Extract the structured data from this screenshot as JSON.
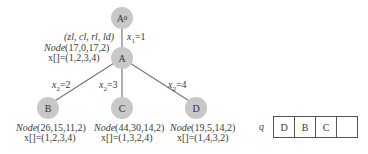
{
  "tree": {
    "root": {
      "label": "A",
      "sub": "0"
    },
    "node_a": {
      "label": "A",
      "params": "(zl, cl, rl, ld)",
      "node_name": "Node",
      "node_args": "(17,0,17,2)",
      "x_label": "x[]=(1,2,3,4)",
      "edge_label": "x",
      "edge_sub": "1",
      "edge_val": "=1"
    },
    "children": [
      {
        "label": "B",
        "node_name": "Node",
        "node_args": "(26,15,11,2)",
        "x_label": "x[]=(1,2,3,4)",
        "edge_label": "x",
        "edge_sub": "2",
        "edge_val": "=2"
      },
      {
        "label": "C",
        "node_name": "Node",
        "node_args": "(44,30,14,2)",
        "x_label": "x[]=(1,3,2,4)",
        "edge_label": "x",
        "edge_sub": "2",
        "edge_val": "=3"
      },
      {
        "label": "D",
        "node_name": "Node",
        "node_args": "(19,5,14,2)",
        "x_label": "x[]=(1,4,3,2)",
        "edge_label": "x",
        "edge_sub": "2",
        "edge_val": "=4"
      }
    ]
  },
  "queue": {
    "label": "q",
    "cells": [
      "D",
      "B",
      "C",
      ""
    ]
  },
  "colors": {
    "node_fill": "#c8c8c8",
    "edge": "#777777"
  }
}
